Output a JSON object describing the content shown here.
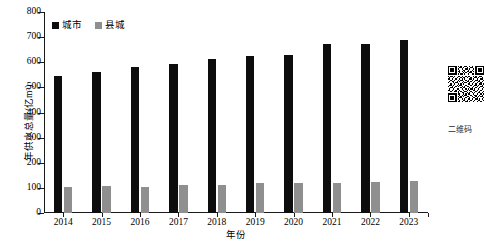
{
  "chart_data": {
    "type": "bar",
    "title": "",
    "xlabel": "年份",
    "ylabel": "年供水总量(亿m³)",
    "categories": [
      "2014",
      "2015",
      "2016",
      "2017",
      "2018",
      "2019",
      "2020",
      "2021",
      "2022",
      "2023"
    ],
    "series": [
      {
        "name": "城市",
        "color": "#0d0d0d",
        "values": [
          547,
          560,
          580,
          592,
          612,
          625,
          627,
          672,
          672,
          687
        ]
      },
      {
        "name": "县城",
        "color": "#8f8f8f",
        "values": [
          105,
          106,
          105,
          112,
          113,
          118,
          118,
          121,
          123,
          128
        ]
      }
    ],
    "ylim": [
      0,
      800
    ],
    "yticks": [
      0,
      100,
      200,
      300,
      400,
      500,
      600,
      700,
      800
    ],
    "ytick_labels": [
      "0",
      "100",
      "200",
      "300",
      "400",
      "500",
      "600",
      "700",
      "800"
    ],
    "grid": false,
    "legend_position": "top-left-inside"
  },
  "legend": {
    "items": [
      {
        "label": "城市",
        "color": "#0d0d0d"
      },
      {
        "label": "县城",
        "color": "#8f8f8f"
      }
    ]
  },
  "sidebar": {
    "qr_caption": "二维码"
  }
}
